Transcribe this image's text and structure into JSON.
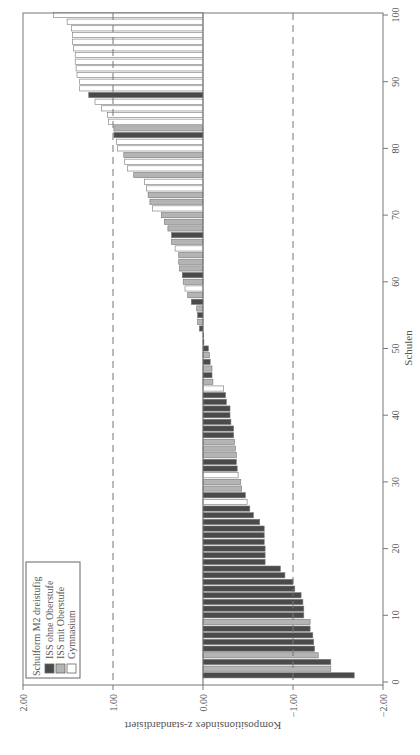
{
  "chart_data": {
    "type": "bar",
    "orientation": "horizontal (figure printed rotated 90 degrees)",
    "xlabel": "Schulen",
    "ylabel": "Kompositionsindex z-standardisiert",
    "x_ticks": [
      "0",
      "10",
      "20",
      "30",
      "40",
      "50",
      "60",
      "70",
      "80",
      "90",
      "100"
    ],
    "y_ticks": [
      "2.00",
      "1.00",
      "0.00",
      "−1.00",
      "−2.00"
    ],
    "ylim": [
      -2.0,
      2.0
    ],
    "reference_lines": [
      1.0,
      -1.0
    ],
    "reference_line_style": "dashed",
    "legend": {
      "title": "Schulform M2 dreistufig",
      "position": "lower-left",
      "entries": [
        {
          "key": "D",
          "label": "ISS ohne Oberstufe",
          "color": "#4a4a4a"
        },
        {
          "key": "G",
          "label": "ISS mit Oberstufe",
          "color": "#b4b4b4"
        },
        {
          "key": "W",
          "label": "Gymnasium",
          "color": "#ffffff"
        }
      ]
    },
    "schools": [
      {
        "x": 1,
        "value": -1.68,
        "type": "D"
      },
      {
        "x": 2,
        "value": -1.42,
        "type": "G"
      },
      {
        "x": 3,
        "value": -1.42,
        "type": "D"
      },
      {
        "x": 4,
        "value": -1.28,
        "type": "G"
      },
      {
        "x": 5,
        "value": -1.24,
        "type": "D"
      },
      {
        "x": 6,
        "value": -1.23,
        "type": "D"
      },
      {
        "x": 7,
        "value": -1.22,
        "type": "D"
      },
      {
        "x": 8,
        "value": -1.19,
        "type": "D"
      },
      {
        "x": 9,
        "value": -1.19,
        "type": "G"
      },
      {
        "x": 10,
        "value": -1.12,
        "type": "D"
      },
      {
        "x": 11,
        "value": -1.12,
        "type": "D"
      },
      {
        "x": 12,
        "value": -1.11,
        "type": "D"
      },
      {
        "x": 13,
        "value": -1.09,
        "type": "D"
      },
      {
        "x": 14,
        "value": -1.02,
        "type": "D"
      },
      {
        "x": 15,
        "value": -1.0,
        "type": "D"
      },
      {
        "x": 16,
        "value": -0.91,
        "type": "D"
      },
      {
        "x": 17,
        "value": -0.86,
        "type": "D"
      },
      {
        "x": 18,
        "value": -0.69,
        "type": "D"
      },
      {
        "x": 19,
        "value": -0.69,
        "type": "D"
      },
      {
        "x": 20,
        "value": -0.69,
        "type": "D"
      },
      {
        "x": 21,
        "value": -0.68,
        "type": "D"
      },
      {
        "x": 22,
        "value": -0.68,
        "type": "D"
      },
      {
        "x": 23,
        "value": -0.68,
        "type": "D"
      },
      {
        "x": 24,
        "value": -0.63,
        "type": "D"
      },
      {
        "x": 25,
        "value": -0.56,
        "type": "D"
      },
      {
        "x": 26,
        "value": -0.52,
        "type": "D"
      },
      {
        "x": 27,
        "value": -0.49,
        "type": "W"
      },
      {
        "x": 28,
        "value": -0.47,
        "type": "D"
      },
      {
        "x": 29,
        "value": -0.43,
        "type": "G"
      },
      {
        "x": 30,
        "value": -0.42,
        "type": "G"
      },
      {
        "x": 31,
        "value": -0.39,
        "type": "W"
      },
      {
        "x": 32,
        "value": -0.38,
        "type": "D"
      },
      {
        "x": 33,
        "value": -0.37,
        "type": "D"
      },
      {
        "x": 34,
        "value": -0.37,
        "type": "G"
      },
      {
        "x": 35,
        "value": -0.36,
        "type": "G"
      },
      {
        "x": 36,
        "value": -0.35,
        "type": "G"
      },
      {
        "x": 37,
        "value": -0.34,
        "type": "D"
      },
      {
        "x": 38,
        "value": -0.34,
        "type": "D"
      },
      {
        "x": 39,
        "value": -0.31,
        "type": "D"
      },
      {
        "x": 40,
        "value": -0.3,
        "type": "D"
      },
      {
        "x": 41,
        "value": -0.3,
        "type": "D"
      },
      {
        "x": 42,
        "value": -0.26,
        "type": "D"
      },
      {
        "x": 43,
        "value": -0.25,
        "type": "D"
      },
      {
        "x": 44,
        "value": -0.23,
        "type": "W"
      },
      {
        "x": 45,
        "value": -0.11,
        "type": "G"
      },
      {
        "x": 46,
        "value": -0.1,
        "type": "D"
      },
      {
        "x": 47,
        "value": -0.1,
        "type": "G"
      },
      {
        "x": 48,
        "value": -0.08,
        "type": "D"
      },
      {
        "x": 49,
        "value": -0.07,
        "type": "G"
      },
      {
        "x": 50,
        "value": -0.06,
        "type": "D"
      },
      {
        "x": 51,
        "value": -0.01,
        "type": "D"
      },
      {
        "x": 52,
        "value": 0.0,
        "type": "D"
      },
      {
        "x": 53,
        "value": 0.04,
        "type": "D"
      },
      {
        "x": 54,
        "value": 0.06,
        "type": "G"
      },
      {
        "x": 55,
        "value": 0.06,
        "type": "D"
      },
      {
        "x": 56,
        "value": 0.07,
        "type": "G"
      },
      {
        "x": 57,
        "value": 0.13,
        "type": "D"
      },
      {
        "x": 58,
        "value": 0.17,
        "type": "G"
      },
      {
        "x": 59,
        "value": 0.2,
        "type": "W"
      },
      {
        "x": 60,
        "value": 0.22,
        "type": "G"
      },
      {
        "x": 61,
        "value": 0.23,
        "type": "D"
      },
      {
        "x": 62,
        "value": 0.26,
        "type": "G"
      },
      {
        "x": 63,
        "value": 0.27,
        "type": "G"
      },
      {
        "x": 64,
        "value": 0.27,
        "type": "G"
      },
      {
        "x": 65,
        "value": 0.31,
        "type": "W"
      },
      {
        "x": 66,
        "value": 0.35,
        "type": "G"
      },
      {
        "x": 67,
        "value": 0.35,
        "type": "D"
      },
      {
        "x": 68,
        "value": 0.39,
        "type": "G"
      },
      {
        "x": 69,
        "value": 0.43,
        "type": "G"
      },
      {
        "x": 70,
        "value": 0.46,
        "type": "G"
      },
      {
        "x": 71,
        "value": 0.56,
        "type": "W"
      },
      {
        "x": 72,
        "value": 0.59,
        "type": "G"
      },
      {
        "x": 73,
        "value": 0.61,
        "type": "G"
      },
      {
        "x": 74,
        "value": 0.63,
        "type": "W"
      },
      {
        "x": 75,
        "value": 0.65,
        "type": "W"
      },
      {
        "x": 76,
        "value": 0.77,
        "type": "G"
      },
      {
        "x": 77,
        "value": 0.84,
        "type": "W"
      },
      {
        "x": 78,
        "value": 0.87,
        "type": "W"
      },
      {
        "x": 79,
        "value": 0.88,
        "type": "G"
      },
      {
        "x": 80,
        "value": 0.95,
        "type": "W"
      },
      {
        "x": 81,
        "value": 0.96,
        "type": "W"
      },
      {
        "x": 82,
        "value": 0.99,
        "type": "D"
      },
      {
        "x": 83,
        "value": 0.99,
        "type": "G"
      },
      {
        "x": 84,
        "value": 1.05,
        "type": "W"
      },
      {
        "x": 85,
        "value": 1.06,
        "type": "W"
      },
      {
        "x": 86,
        "value": 1.13,
        "type": "W"
      },
      {
        "x": 87,
        "value": 1.2,
        "type": "W"
      },
      {
        "x": 88,
        "value": 1.27,
        "type": "D"
      },
      {
        "x": 89,
        "value": 1.37,
        "type": "W"
      },
      {
        "x": 90,
        "value": 1.37,
        "type": "W"
      },
      {
        "x": 91,
        "value": 1.4,
        "type": "W"
      },
      {
        "x": 92,
        "value": 1.41,
        "type": "W"
      },
      {
        "x": 93,
        "value": 1.42,
        "type": "W"
      },
      {
        "x": 94,
        "value": 1.42,
        "type": "W"
      },
      {
        "x": 95,
        "value": 1.44,
        "type": "W"
      },
      {
        "x": 96,
        "value": 1.45,
        "type": "W"
      },
      {
        "x": 97,
        "value": 1.45,
        "type": "W"
      },
      {
        "x": 98,
        "value": 1.46,
        "type": "W"
      },
      {
        "x": 99,
        "value": 1.51,
        "type": "W"
      },
      {
        "x": 100,
        "value": 1.66,
        "type": "W"
      }
    ],
    "grid": false
  }
}
